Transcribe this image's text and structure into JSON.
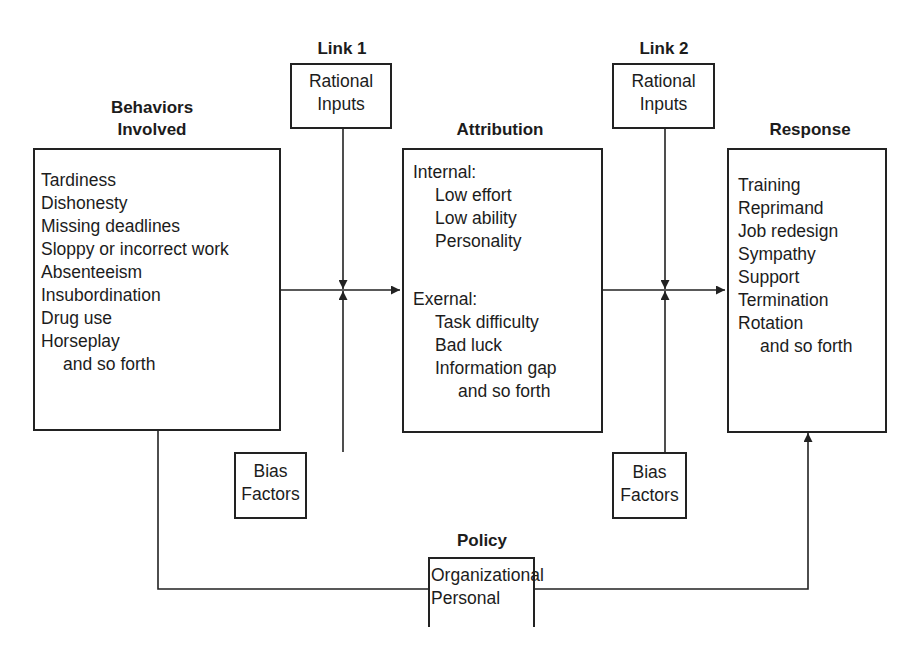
{
  "diagram": {
    "behaviors": {
      "title_line1": "Behaviors",
      "title_line2": "Involved",
      "items": [
        "Tardiness",
        "Dishonesty",
        "Missing deadlines",
        "Sloppy or incorrect work",
        "Absenteeism",
        "Insubordination",
        "Drug use",
        "Horseplay"
      ],
      "etc": "and so forth"
    },
    "link1": {
      "title": "Link 1",
      "rational_line1": "Rational",
      "rational_line2": "Inputs",
      "bias_line1": "Bias",
      "bias_line2": "Factors"
    },
    "attribution": {
      "title": "Attribution",
      "internal_label": "Internal:",
      "internal_items": [
        "Low effort",
        "Low ability",
        "Personality"
      ],
      "external_label": "Exernal:",
      "external_items": [
        "Task difficulty",
        "Bad luck",
        "Information gap"
      ],
      "etc": "and so forth"
    },
    "link2": {
      "title": "Link 2",
      "rational_line1": "Rational",
      "rational_line2": "Inputs",
      "bias_line1": "Bias",
      "bias_line2": "Factors"
    },
    "response": {
      "title": "Response",
      "items": [
        "Training",
        "Reprimand",
        "Job redesign",
        "Sympathy",
        "Support",
        "Termination",
        "Rotation"
      ],
      "etc": "and so forth"
    },
    "policy": {
      "title": "Policy",
      "items": [
        "Organizational",
        "Personal"
      ]
    }
  }
}
